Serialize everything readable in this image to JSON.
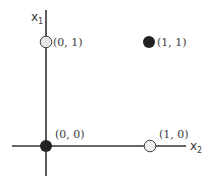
{
  "diagram": {
    "title": "",
    "axes": {
      "x_label": "x",
      "x_sub": "2",
      "y_label": "x",
      "y_sub": "1",
      "color": "#333333"
    },
    "points": [
      {
        "label": "(0, 1)",
        "coords": [
          0,
          1
        ],
        "fill": "open",
        "color": "#d8d8d8"
      },
      {
        "label": "(1, 1)",
        "coords": [
          1,
          1
        ],
        "fill": "filled",
        "color": "#222222"
      },
      {
        "label": "(0, 0)",
        "coords": [
          0,
          0
        ],
        "fill": "filled",
        "color": "#222222"
      },
      {
        "label": "(1, 0)",
        "coords": [
          1,
          0
        ],
        "fill": "open",
        "color": "#d8d8d8"
      }
    ]
  }
}
